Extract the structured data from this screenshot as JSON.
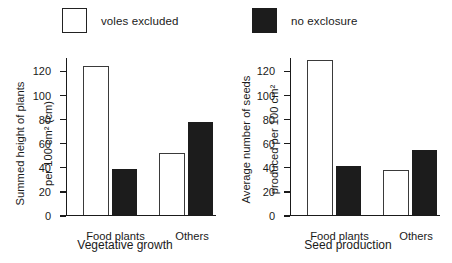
{
  "legend": {
    "entries": [
      {
        "label": "voles excluded",
        "swatch": "open-square-icon",
        "color": "#ffffff"
      },
      {
        "label": "no exclosure",
        "swatch": "filled-square-icon",
        "color": "#1c1c1c"
      }
    ]
  },
  "charts": {
    "left": {
      "ylabel_line1": "Summed height of plants",
      "ylabel_line2": "per 100 cm² (cm)",
      "xlabel": "Vegetative growth",
      "ticks": [
        "0",
        "20",
        "40",
        "60",
        "80",
        "100",
        "120"
      ],
      "groups": [
        "Food plants",
        "Others"
      ]
    },
    "right": {
      "ylabel_line1": "Average number of seeds",
      "ylabel_line2": "produced per 100 cm²",
      "xlabel": "Seed production",
      "ticks": [
        "0",
        "20",
        "40",
        "60",
        "80",
        "100",
        "120"
      ],
      "groups": [
        "Food plants",
        "Others"
      ]
    }
  },
  "chart_data": [
    {
      "type": "bar",
      "title": "",
      "xlabel": "Vegetative growth",
      "ylabel": "Summed height of plants per 100 cm2 (cm)",
      "categories": [
        "Food plants",
        "Others"
      ],
      "series": [
        {
          "name": "voles excluded",
          "color": "#ffffff",
          "values": [
            123,
            51
          ]
        },
        {
          "name": "no exclosure",
          "color": "#1c1c1c",
          "values": [
            38,
            77
          ]
        }
      ],
      "ylim": [
        0,
        130
      ],
      "yticks": [
        0,
        20,
        40,
        60,
        80,
        100,
        120
      ],
      "grid": false,
      "legend_position": "top"
    },
    {
      "type": "bar",
      "title": "",
      "xlabel": "Seed production",
      "ylabel": "Average number of seeds produced per 100 cm2",
      "categories": [
        "Food plants",
        "Others"
      ],
      "series": [
        {
          "name": "voles excluded",
          "color": "#ffffff",
          "values": [
            128,
            37
          ]
        },
        {
          "name": "no exclosure",
          "color": "#1c1c1c",
          "values": [
            40,
            54
          ]
        }
      ],
      "ylim": [
        0,
        130
      ],
      "yticks": [
        0,
        20,
        40,
        60,
        80,
        100,
        120
      ],
      "grid": false,
      "legend_position": "top"
    }
  ]
}
